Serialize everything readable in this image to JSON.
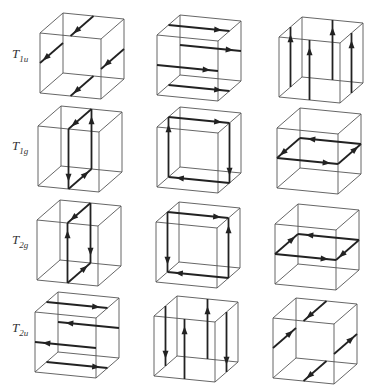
{
  "figure": {
    "type": "symmetry-adapted displacement patterns on cubes",
    "rows": [
      {
        "label_main": "T",
        "label_sub": "1u",
        "cubes": [
          {
            "arrows": [
              {
                "axis": "z",
                "at": [
                  0.5,
                  1
                ],
                "dir": -1
              },
              {
                "axis": "z",
                "at": [
                  0,
                  0.5
                ],
                "dir": -1
              },
              {
                "axis": "z",
                "at": [
                  1,
                  0.5
                ],
                "dir": -1
              },
              {
                "axis": "z",
                "at": [
                  0.5,
                  0
                ],
                "dir": -1
              }
            ]
          },
          {
            "arrows": [
              {
                "axis": "x",
                "at": [
                  1,
                  0.5
                ],
                "dir": 1
              },
              {
                "axis": "x",
                "at": [
                  0.5,
                  1
                ],
                "dir": 1
              },
              {
                "axis": "x",
                "at": [
                  0.5,
                  0
                ],
                "dir": 1
              },
              {
                "axis": "x",
                "at": [
                  0,
                  0.5
                ],
                "dir": 1
              }
            ]
          },
          {
            "arrows": [
              {
                "axis": "y",
                "at": [
                  0,
                  0.5
                ],
                "dir": 1
              },
              {
                "axis": "y",
                "at": [
                  0.5,
                  0
                ],
                "dir": 1
              },
              {
                "axis": "y",
                "at": [
                  0.5,
                  1
                ],
                "dir": 1
              },
              {
                "axis": "y",
                "at": [
                  1,
                  0.5
                ],
                "dir": 1
              }
            ]
          }
        ]
      },
      {
        "label_main": "T",
        "label_sub": "1g",
        "cubes": [
          {
            "arrows": [
              {
                "axis": "y",
                "at": [
                  0.5,
                  0
                ],
                "dir": -1
              },
              {
                "axis": "z",
                "at": [
                  0.5,
                  0
                ],
                "dir": 1
              },
              {
                "axis": "y",
                "at": [
                  0.5,
                  1
                ],
                "dir": 1
              },
              {
                "axis": "z",
                "at": [
                  0.5,
                  1
                ],
                "dir": -1
              }
            ]
          },
          {
            "arrows": [
              {
                "axis": "x",
                "at": [
                  1,
                  0.5
                ],
                "dir": 1
              },
              {
                "axis": "y",
                "at": [
                  1,
                  0.5
                ],
                "dir": -1
              },
              {
                "axis": "x",
                "at": [
                  0,
                  0.5
                ],
                "dir": -1
              },
              {
                "axis": "y",
                "at": [
                  0,
                  0.5
                ],
                "dir": 1
              }
            ]
          },
          {
            "arrows": [
              {
                "axis": "x",
                "at": [
                  0.5,
                  1
                ],
                "dir": -1
              },
              {
                "axis": "z",
                "at": [
                  0,
                  0.5
                ],
                "dir": -1
              },
              {
                "axis": "x",
                "at": [
                  0.5,
                  0
                ],
                "dir": 1
              },
              {
                "axis": "z",
                "at": [
                  1,
                  0.5
                ],
                "dir": 1
              }
            ]
          }
        ]
      },
      {
        "label_main": "T",
        "label_sub": "2g",
        "cubes": [
          {
            "arrows": [
              {
                "axis": "y",
                "at": [
                  0.5,
                  0
                ],
                "dir": 1
              },
              {
                "axis": "z",
                "at": [
                  0.5,
                  0
                ],
                "dir": 1
              },
              {
                "axis": "y",
                "at": [
                  0.5,
                  1
                ],
                "dir": -1
              },
              {
                "axis": "z",
                "at": [
                  0.5,
                  1
                ],
                "dir": -1
              }
            ]
          },
          {
            "arrows": [
              {
                "axis": "x",
                "at": [
                  1,
                  0.5
                ],
                "dir": 1
              },
              {
                "axis": "y",
                "at": [
                  1,
                  0.5
                ],
                "dir": 1
              },
              {
                "axis": "x",
                "at": [
                  0,
                  0.5
                ],
                "dir": -1
              },
              {
                "axis": "y",
                "at": [
                  0,
                  0.5
                ],
                "dir": -1
              }
            ]
          },
          {
            "arrows": [
              {
                "axis": "x",
                "at": [
                  0.5,
                  1
                ],
                "dir": -1
              },
              {
                "axis": "z",
                "at": [
                  0,
                  0.5
                ],
                "dir": 1
              },
              {
                "axis": "x",
                "at": [
                  0.5,
                  0
                ],
                "dir": 1
              },
              {
                "axis": "z",
                "at": [
                  1,
                  0.5
                ],
                "dir": -1
              }
            ]
          }
        ]
      },
      {
        "label_main": "T",
        "label_sub": "2u",
        "cubes": [
          {
            "arrows": [
              {
                "axis": "x",
                "at": [
                  1,
                  0.5
                ],
                "dir": 1
              },
              {
                "axis": "x",
                "at": [
                  0.5,
                  1
                ],
                "dir": -1
              },
              {
                "axis": "x",
                "at": [
                  0.5,
                  0
                ],
                "dir": -1
              },
              {
                "axis": "x",
                "at": [
                  0,
                  0.5
                ],
                "dir": 1
              }
            ]
          },
          {
            "arrows": [
              {
                "axis": "y",
                "at": [
                  0,
                  0.5
                ],
                "dir": -1
              },
              {
                "axis": "y",
                "at": [
                  0.5,
                  1
                ],
                "dir": 1
              },
              {
                "axis": "y",
                "at": [
                  0.5,
                  0
                ],
                "dir": 1
              },
              {
                "axis": "y",
                "at": [
                  1,
                  0.5
                ],
                "dir": -1
              }
            ]
          },
          {
            "arrows": [
              {
                "axis": "z",
                "at": [
                  0.5,
                  1
                ],
                "dir": -1
              },
              {
                "axis": "z",
                "at": [
                  0,
                  0.5
                ],
                "dir": 1
              },
              {
                "axis": "z",
                "at": [
                  1,
                  0.5
                ],
                "dir": 1
              },
              {
                "axis": "z",
                "at": [
                  0.5,
                  0
                ],
                "dir": -1
              }
            ]
          }
        ]
      }
    ],
    "layout": {
      "origins": [
        [
          [
            40,
            93
          ],
          [
            157,
            95
          ],
          [
            279,
            97
          ]
        ],
        [
          [
            38,
            186
          ],
          [
            157,
            187
          ],
          [
            277,
            188
          ]
        ],
        [
          [
            37,
            280
          ],
          [
            156,
            282
          ],
          [
            275,
            284
          ]
        ],
        [
          [
            35,
            372
          ],
          [
            154,
            376
          ],
          [
            273,
            378
          ]
        ]
      ],
      "label_positions": [
        [
          12,
          58
        ],
        [
          12,
          150
        ],
        [
          12,
          244
        ],
        [
          12,
          332
        ]
      ],
      "ex": [
        61,
        6
      ],
      "ey": [
        0,
        -60
      ],
      "ez": [
        23,
        -20
      ]
    }
  }
}
